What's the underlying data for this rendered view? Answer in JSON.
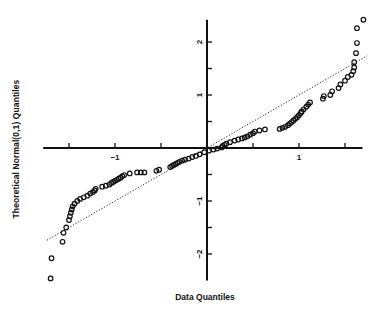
{
  "chart_data": {
    "type": "scatter",
    "title": "",
    "xlabel": "Data Quantiles",
    "ylabel": "Theoretical Normal(0,1) Quantiles",
    "x_ticks": [
      -1.5,
      -1,
      -0.5,
      0,
      0.5,
      1,
      1.5
    ],
    "x_tick_labels": {
      "-1": "-1",
      "1": "1"
    },
    "y_ticks": [
      -2,
      -1.5,
      -1,
      -0.5,
      0,
      0.5,
      1,
      1.5,
      2
    ],
    "y_tick_labels": {
      "-2": "-2",
      "-1": "-1",
      "1": "1",
      "2": "2"
    },
    "xlim": [
      -1.78,
      1.69
    ],
    "ylim": [
      -2.5,
      2.42
    ],
    "axes_through_origin": true,
    "grid": false,
    "legend": null,
    "reference_line": {
      "style": "dotted",
      "slope": 1,
      "intercept": 0,
      "from": [
        -1.74,
        -1.74
      ],
      "to": [
        1.74,
        1.74
      ]
    },
    "marker": "open-circle",
    "series": [
      {
        "name": "quantiles",
        "points": [
          [
            -1.7,
            -2.46
          ],
          [
            -1.69,
            -2.08
          ],
          [
            -1.57,
            -1.77
          ],
          [
            -1.56,
            -1.6
          ],
          [
            -1.53,
            -1.5
          ],
          [
            -1.5,
            -1.36
          ],
          [
            -1.49,
            -1.29
          ],
          [
            -1.48,
            -1.22
          ],
          [
            -1.47,
            -1.16
          ],
          [
            -1.46,
            -1.1
          ],
          [
            -1.44,
            -1.05
          ],
          [
            -1.41,
            -1.0
          ],
          [
            -1.38,
            -0.96
          ],
          [
            -1.34,
            -0.93
          ],
          [
            -1.3,
            -0.9
          ],
          [
            -1.27,
            -0.86
          ],
          [
            -1.24,
            -0.83
          ],
          [
            -1.22,
            -0.8
          ],
          [
            -1.21,
            -0.77
          ],
          [
            -1.14,
            -0.73
          ],
          [
            -1.1,
            -0.71
          ],
          [
            -1.06,
            -0.69
          ],
          [
            -1.04,
            -0.66
          ],
          [
            -1.02,
            -0.64
          ],
          [
            -1.0,
            -0.62
          ],
          [
            -0.98,
            -0.6
          ],
          [
            -0.96,
            -0.58
          ],
          [
            -0.94,
            -0.56
          ],
          [
            -0.92,
            -0.53
          ],
          [
            -0.9,
            -0.51
          ],
          [
            -0.84,
            -0.48
          ],
          [
            -0.76,
            -0.46
          ],
          [
            -0.72,
            -0.46
          ],
          [
            -0.68,
            -0.46
          ],
          [
            -0.55,
            -0.43
          ],
          [
            -0.52,
            -0.41
          ],
          [
            -0.4,
            -0.36
          ],
          [
            -0.38,
            -0.34
          ],
          [
            -0.36,
            -0.32
          ],
          [
            -0.34,
            -0.3
          ],
          [
            -0.32,
            -0.28
          ],
          [
            -0.3,
            -0.26
          ],
          [
            -0.27,
            -0.24
          ],
          [
            -0.24,
            -0.22
          ],
          [
            -0.2,
            -0.2
          ],
          [
            -0.16,
            -0.17
          ],
          [
            -0.12,
            -0.15
          ],
          [
            -0.08,
            -0.12
          ],
          [
            -0.03,
            -0.08
          ],
          [
            0.02,
            -0.05
          ],
          [
            0.07,
            -0.03
          ],
          [
            0.11,
            -0.01
          ],
          [
            0.16,
            0.01
          ],
          [
            0.17,
            0.04
          ],
          [
            0.19,
            0.06
          ],
          [
            0.21,
            0.08
          ],
          [
            0.25,
            0.11
          ],
          [
            0.3,
            0.14
          ],
          [
            0.34,
            0.16
          ],
          [
            0.38,
            0.18
          ],
          [
            0.41,
            0.2
          ],
          [
            0.44,
            0.22
          ],
          [
            0.47,
            0.25
          ],
          [
            0.5,
            0.28
          ],
          [
            0.52,
            0.31
          ],
          [
            0.57,
            0.33
          ],
          [
            0.63,
            0.35
          ],
          [
            0.79,
            0.36
          ],
          [
            0.82,
            0.38
          ],
          [
            0.85,
            0.4
          ],
          [
            0.88,
            0.43
          ],
          [
            0.9,
            0.46
          ],
          [
            0.92,
            0.49
          ],
          [
            0.94,
            0.52
          ],
          [
            0.96,
            0.55
          ],
          [
            0.98,
            0.58
          ],
          [
            1.0,
            0.62
          ],
          [
            1.02,
            0.66
          ],
          [
            1.03,
            0.69
          ],
          [
            1.05,
            0.73
          ],
          [
            1.08,
            0.78
          ],
          [
            1.1,
            0.82
          ],
          [
            1.12,
            0.86
          ],
          [
            1.26,
            0.93
          ],
          [
            1.27,
            0.98
          ],
          [
            1.34,
            1.0
          ],
          [
            1.36,
            1.07
          ],
          [
            1.43,
            1.13
          ],
          [
            1.45,
            1.2
          ],
          [
            1.5,
            1.27
          ],
          [
            1.53,
            1.34
          ],
          [
            1.57,
            1.38
          ],
          [
            1.59,
            1.45
          ],
          [
            1.6,
            1.52
          ],
          [
            1.6,
            1.62
          ],
          [
            1.62,
            1.79
          ],
          [
            1.63,
            1.98
          ],
          [
            1.63,
            2.26
          ],
          [
            1.7,
            2.42
          ]
        ]
      }
    ]
  }
}
